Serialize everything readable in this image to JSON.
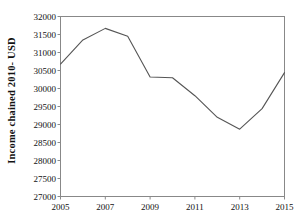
{
  "chart_data": {
    "type": "line",
    "title": "",
    "subtitle": "",
    "xlabel": "",
    "ylabel": "Income  chained 2010- USD",
    "x": [
      2005,
      2006,
      2007,
      2008,
      2009,
      2010,
      2011,
      2012,
      2013,
      2014,
      2015
    ],
    "values": [
      30680,
      31350,
      31670,
      31450,
      30320,
      30300,
      29800,
      29200,
      28870,
      29440,
      30440
    ],
    "series": [
      {
        "name": "Income chained 2010- USD",
        "values": [
          30680,
          31350,
          31670,
          31450,
          30320,
          30300,
          29800,
          29200,
          28870,
          29440,
          30440
        ]
      }
    ],
    "ylim": [
      27000,
      32000
    ],
    "xlim": [
      2005,
      2015
    ],
    "yticks": [
      27000,
      27500,
      28000,
      28500,
      29000,
      29500,
      30000,
      30500,
      31000,
      31500,
      32000
    ],
    "ytick_labels": [
      "27000",
      "27500",
      "28000",
      "28500",
      "29000",
      "29500",
      "30000",
      "30500",
      "31000",
      "31500",
      "32000"
    ],
    "xticks": [
      2005,
      2007,
      2009,
      2011,
      2013,
      2015
    ],
    "xtick_labels": [
      "2005",
      "2007",
      "2009",
      "2011",
      "2013",
      "2015"
    ],
    "grid": false,
    "legend": false,
    "legend_position": "none",
    "line_color": "#555555",
    "axis_color": "#888888",
    "background_color": "#ffffff"
  }
}
